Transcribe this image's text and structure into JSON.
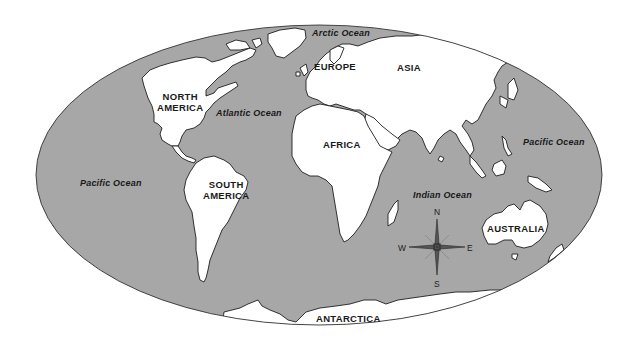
{
  "map": {
    "projection": "world-ellipse",
    "colors": {
      "ocean": "#a7a7a7",
      "land": "#ffffff",
      "outline": "#1e1e1e",
      "text": "#1a1a1a"
    },
    "continents": [
      {
        "id": "north-america",
        "label_line1": "NORTH",
        "label_line2": "AMERICA"
      },
      {
        "id": "south-america",
        "label_line1": "SOUTH",
        "label_line2": "AMERICA"
      },
      {
        "id": "europe",
        "label": "EUROPE"
      },
      {
        "id": "asia",
        "label": "ASIA"
      },
      {
        "id": "africa",
        "label": "AFRICA"
      },
      {
        "id": "australia",
        "label": "AUSTRALIA"
      },
      {
        "id": "antarctica",
        "label": "ANTARCTICA"
      }
    ],
    "oceans": [
      {
        "id": "arctic",
        "label": "Arctic Ocean"
      },
      {
        "id": "atlantic",
        "label": "Atlantic Ocean"
      },
      {
        "id": "pacific-west",
        "label": "Pacific Ocean"
      },
      {
        "id": "pacific-east",
        "label": "Pacific Ocean"
      },
      {
        "id": "indian",
        "label": "Indian Ocean"
      }
    ],
    "compass": {
      "north": "N",
      "south": "S",
      "east": "E",
      "west": "W"
    }
  }
}
